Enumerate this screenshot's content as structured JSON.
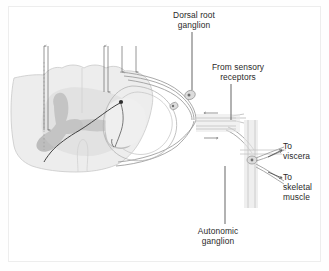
{
  "figure": {
    "background_color": "#ffffff",
    "border_color": "#ededed",
    "ink_color": "#6b6b6b",
    "text_color": "#2a2a2a",
    "gray_matter_color": "#b9b9b9",
    "white_matter_color": "#eaeaea",
    "nerve_color": "#9a9a9a",
    "neuron_color": "#3a3a3a"
  },
  "labels": {
    "dorsal_root_ganglion": "Dorsal root\nganglion",
    "from_sensory_receptors": "From sensory\nreceptors",
    "to_viscera": "To\nviscera",
    "to_skeletal_muscle": "To\nskeletal\nmuscle",
    "autonomic_ganglion": "Autonomic\nganglion"
  },
  "structures": {
    "spinal_cord": "spinal-cord-cross-section",
    "gray_matter": "butterfly-gray-matter",
    "central_canal": "central-canal",
    "dorsal_root": "dorsal-root",
    "ventral_root": "ventral-root",
    "dorsal_root_ganglion": "dorsal-root-ganglion-circle",
    "autonomic_ganglion": "autonomic-ganglion-branch",
    "spinal_nerve": "spinal-nerve-trunk",
    "sensory_neuron": "sensory-neuron-trace",
    "interneuron": "interneuron-trace"
  },
  "tract_arrows": [
    {
      "name": "ascending-tract-arrow-left",
      "direction": "up"
    },
    {
      "name": "descending-tract-arrow-left",
      "direction": "down"
    },
    {
      "name": "ascending-tract-arrow-mid",
      "direction": "up"
    },
    {
      "name": "descending-tract-arrow-mid",
      "direction": "down"
    },
    {
      "name": "descending-tract-arrow-right-1",
      "direction": "down"
    },
    {
      "name": "descending-tract-arrow-right-2",
      "direction": "down"
    }
  ],
  "flow_arrows": [
    {
      "name": "afferent-flow-arrow",
      "direction": "left"
    },
    {
      "name": "efferent-flow-arrow",
      "direction": "right"
    }
  ]
}
